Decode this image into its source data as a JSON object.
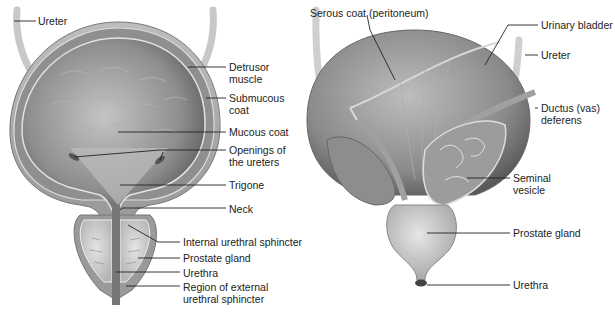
{
  "figure": {
    "left_panel": {
      "view": "coronal section",
      "labels": {
        "ureter": "Ureter",
        "detrusor_muscle": [
          "Detrusor",
          "muscle"
        ],
        "submucous_coat": [
          "Submucous",
          "coat"
        ],
        "mucous_coat": "Mucous coat",
        "openings_of_ureters": [
          "Openings of",
          "the ureters"
        ],
        "trigone": "Trigone",
        "neck": "Neck",
        "internal_urethral_sphincter": "Internal urethral sphincter",
        "prostate_gland": "Prostate gland",
        "urethra": "Urethra",
        "external_sphincter_region": [
          "Region of external",
          "urethral sphincter"
        ]
      }
    },
    "right_panel": {
      "view": "posterior view",
      "labels": {
        "serous_coat": "Serous coat (peritoneum)",
        "urinary_bladder": "Urinary bladder",
        "ureter": "Ureter",
        "ductus_deferens": [
          "Ductus (vas)",
          "deferens"
        ],
        "seminal_vesicle": [
          "Seminal",
          "vesicle"
        ],
        "prostate_gland": "Prostate gland",
        "urethra": "Urethra"
      }
    },
    "colors": {
      "tissue_light": "#d9d9d9",
      "tissue_mid": "#a8a8a8",
      "tissue_dark": "#6e6e6e",
      "leader_line": "#222222",
      "text": "#222222"
    }
  }
}
